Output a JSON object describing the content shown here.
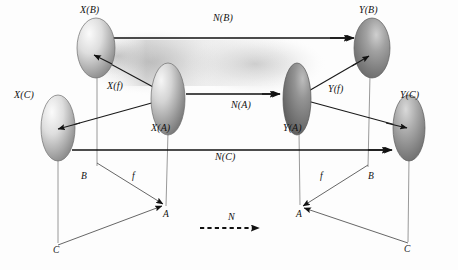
{
  "figure": {
    "background_color": "#fdfdfd",
    "stroke_color": "#1a1a1a",
    "ellipse_fill_light": "#f2f2f2",
    "ellipse_fill_dark": "#6e6e6e",
    "cone_haze_color": "#bfbfbf"
  },
  "top_labels": {
    "x_b": "X(B)",
    "x_c": "X(C)",
    "x_a": "X(A)",
    "x_f": "X(f)",
    "y_b": "Y(B)",
    "y_c": "Y(C)",
    "y_a": "Y(A)",
    "y_f": "Y(f)",
    "n_b": "N(B)",
    "n_a": "N(A)",
    "n_c": "N(C)"
  },
  "base_labels": {
    "left_b": "B",
    "left_f": "f",
    "left_a": "A",
    "left_c": "C",
    "right_a": "A",
    "right_f": "f",
    "right_b": "B",
    "right_c": "C",
    "middle_n": "N"
  },
  "objects": [
    {
      "name": "X(B)",
      "cx": 96,
      "cy": 48,
      "rx": 19,
      "ry": 30
    },
    {
      "name": "X(A)",
      "cx": 168,
      "cy": 99,
      "rx": 17,
      "ry": 36
    },
    {
      "name": "X(C)",
      "cx": 58,
      "cy": 128,
      "rx": 17,
      "ry": 33
    },
    {
      "name": "Y(B)",
      "cx": 372,
      "cy": 48,
      "rx": 18,
      "ry": 30
    },
    {
      "name": "Y(A)",
      "cx": 297,
      "cy": 99,
      "rx": 14,
      "ry": 36
    },
    {
      "name": "Y(C)",
      "cx": 409,
      "cy": 128,
      "rx": 16,
      "ry": 33
    }
  ],
  "arrows": {
    "n_b": {
      "x1": 110,
      "y1": 38,
      "x2": 356,
      "y2": 38,
      "style": "solid",
      "label": "N(B)"
    },
    "n_a": {
      "x1": 186,
      "y1": 94,
      "x2": 282,
      "y2": 94,
      "style": "solid",
      "label": "N(A)"
    },
    "n_c": {
      "x1": 72,
      "y1": 150,
      "x2": 394,
      "y2": 150,
      "style": "solid",
      "label": "N(C)"
    },
    "n_mid": {
      "x1": 200,
      "y1": 228,
      "x2": 266,
      "y2": 228,
      "style": "dashed",
      "label": "N"
    },
    "x_f_to_b": {
      "from": "X(A)",
      "to": "X(B)",
      "label": "X(f)"
    },
    "x_a_to_c": {
      "from": "X(A)",
      "to": "X(C)",
      "label": ""
    },
    "y_f_to_b": {
      "from": "Y(A)",
      "to": "Y(B)",
      "label": "Y(f)"
    },
    "y_a_to_c": {
      "from": "Y(A)",
      "to": "Y(C)",
      "label": ""
    }
  },
  "base_triangles": {
    "left": {
      "b": [
        97,
        163
      ],
      "a": [
        165,
        205
      ],
      "c": [
        58,
        245
      ]
    },
    "right": {
      "b": [
        368,
        165
      ],
      "a": [
        300,
        207
      ],
      "c": [
        408,
        243
      ]
    }
  },
  "projection_lines": [
    {
      "from": "X(B)",
      "to": "left-B"
    },
    {
      "from": "X(A)",
      "to": "left-A"
    },
    {
      "from": "X(C)",
      "to": "left-C"
    },
    {
      "from": "Y(B)",
      "to": "right-B"
    },
    {
      "from": "Y(A)",
      "to": "right-A"
    },
    {
      "from": "Y(C)",
      "to": "right-C"
    }
  ]
}
